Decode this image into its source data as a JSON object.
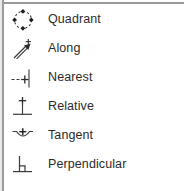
{
  "menu": {
    "name": "snap-mode-menu",
    "background_color": "#ffffff",
    "border_color": "#9a9a9a",
    "text_color": "#2b2b2b",
    "icon_color": "#3a3a3a",
    "items": [
      {
        "label": "Quadrant",
        "icon": "quadrant-snap-icon"
      },
      {
        "label": "Along",
        "icon": "along-snap-icon"
      },
      {
        "label": "Nearest",
        "icon": "nearest-snap-icon"
      },
      {
        "label": "Relative",
        "icon": "relative-snap-icon"
      },
      {
        "label": "Tangent",
        "icon": "tangent-snap-icon"
      },
      {
        "label": "Perpendicular",
        "icon": "perpendicular-snap-icon"
      }
    ]
  }
}
